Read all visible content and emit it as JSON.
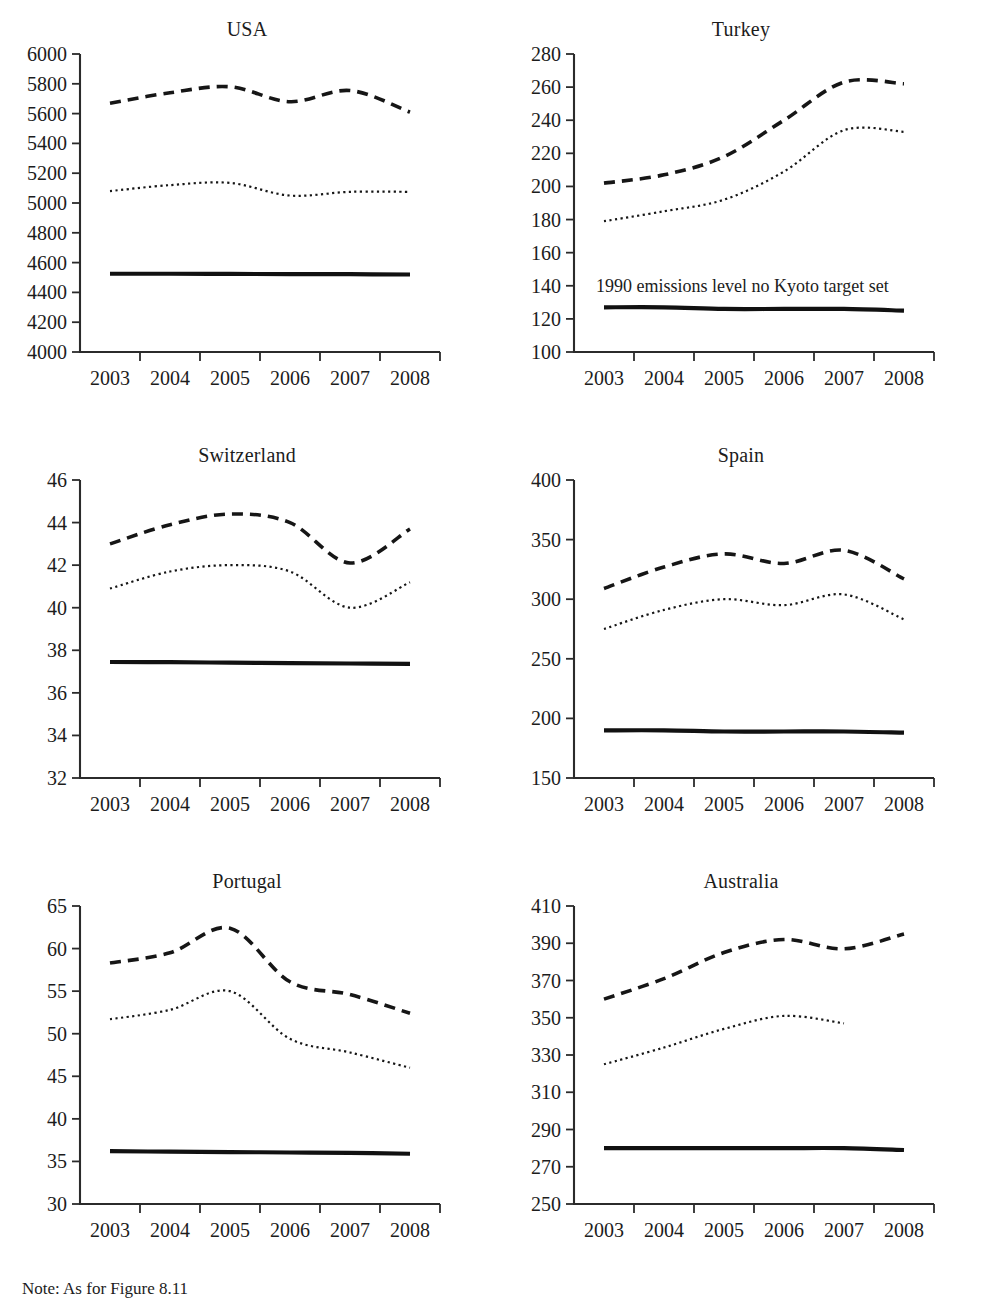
{
  "figure": {
    "note": "Note: As for Figure 8.11",
    "x_categories": [
      "2003",
      "2004",
      "2005",
      "2006",
      "2007",
      "2008"
    ],
    "series_names": [
      "Emissions including LULUCF (dashed)",
      "Emissions excluding LULUCF (dotted)",
      "1990 emissions level / Kyoto target (solid)"
    ],
    "annotation_turkey": "1990 emissions level no Kyoto target set"
  },
  "chart_data": [
    {
      "type": "line",
      "title": "USA",
      "xlabel": "",
      "ylabel": "",
      "x": [
        "2003",
        "2004",
        "2005",
        "2006",
        "2007",
        "2008"
      ],
      "ylim": [
        4000,
        6000
      ],
      "yticks": [
        4000,
        4200,
        4400,
        4600,
        4800,
        5000,
        5200,
        5400,
        5600,
        5800,
        6000
      ],
      "grid": false,
      "legend": "none",
      "series": [
        {
          "name": "dashed",
          "style": "dashed",
          "values": [
            5670,
            5740,
            5780,
            5680,
            5755,
            5610
          ]
        },
        {
          "name": "dotted",
          "style": "dotted",
          "values": [
            5080,
            5120,
            5135,
            5050,
            5075,
            5075
          ]
        },
        {
          "name": "reference",
          "style": "solid",
          "values": [
            4525,
            4525,
            4524,
            4523,
            4522,
            4520
          ]
        }
      ]
    },
    {
      "type": "line",
      "title": "Turkey",
      "xlabel": "",
      "ylabel": "",
      "x": [
        "2003",
        "2004",
        "2005",
        "2006",
        "2007",
        "2008"
      ],
      "ylim": [
        100,
        280
      ],
      "yticks": [
        100,
        120,
        140,
        160,
        180,
        200,
        220,
        240,
        260,
        280
      ],
      "grid": false,
      "legend": "none",
      "annotation": "1990 emissions level no Kyoto target set",
      "series": [
        {
          "name": "dashed",
          "style": "dashed",
          "values": [
            202,
            207,
            218,
            240,
            263,
            262
          ]
        },
        {
          "name": "dotted",
          "style": "dotted",
          "values": [
            179,
            185,
            192,
            209,
            234,
            233
          ]
        },
        {
          "name": "reference",
          "style": "solid",
          "values": [
            127,
            127,
            126,
            126,
            126,
            125
          ]
        }
      ]
    },
    {
      "type": "line",
      "title": "Switzerland",
      "xlabel": "",
      "ylabel": "",
      "x": [
        "2003",
        "2004",
        "2005",
        "2006",
        "2007",
        "2008"
      ],
      "ylim": [
        32,
        46
      ],
      "yticks": [
        32,
        34,
        36,
        38,
        40,
        42,
        44,
        46
      ],
      "grid": false,
      "legend": "none",
      "series": [
        {
          "name": "dashed",
          "style": "dashed",
          "values": [
            43.0,
            43.9,
            44.4,
            44.0,
            42.1,
            43.7
          ]
        },
        {
          "name": "dotted",
          "style": "dotted",
          "values": [
            40.9,
            41.7,
            42.0,
            41.7,
            40.0,
            41.2
          ]
        },
        {
          "name": "reference",
          "style": "solid",
          "values": [
            37.45,
            37.44,
            37.42,
            37.4,
            37.38,
            37.36
          ]
        }
      ]
    },
    {
      "type": "line",
      "title": "Spain",
      "xlabel": "",
      "ylabel": "",
      "x": [
        "2003",
        "2004",
        "2005",
        "2006",
        "2007",
        "2008"
      ],
      "ylim": [
        150,
        400
      ],
      "yticks": [
        150,
        200,
        250,
        300,
        350,
        400
      ],
      "grid": false,
      "legend": "none",
      "series": [
        {
          "name": "dashed",
          "style": "dashed",
          "values": [
            309,
            327,
            338,
            330,
            341,
            317
          ]
        },
        {
          "name": "dotted",
          "style": "dotted",
          "values": [
            275,
            291,
            300,
            295,
            304,
            283
          ]
        },
        {
          "name": "reference",
          "style": "solid",
          "values": [
            190,
            190,
            189,
            189,
            189,
            188
          ]
        }
      ]
    },
    {
      "type": "line",
      "title": "Portugal",
      "xlabel": "",
      "ylabel": "",
      "x": [
        "2003",
        "2004",
        "2005",
        "2006",
        "2007",
        "2008"
      ],
      "ylim": [
        30,
        65
      ],
      "yticks": [
        30,
        35,
        40,
        45,
        50,
        55,
        60,
        65
      ],
      "grid": false,
      "legend": "none",
      "series": [
        {
          "name": "dashed",
          "style": "dashed",
          "values": [
            58.3,
            59.5,
            62.4,
            56.1,
            54.6,
            52.4
          ]
        },
        {
          "name": "dotted",
          "style": "dotted",
          "values": [
            51.7,
            52.8,
            55.0,
            49.4,
            47.8,
            46.0
          ]
        },
        {
          "name": "reference",
          "style": "solid",
          "values": [
            36.2,
            36.15,
            36.1,
            36.05,
            36.0,
            35.9
          ]
        }
      ]
    },
    {
      "type": "line",
      "title": "Australia",
      "xlabel": "",
      "ylabel": "",
      "x": [
        "2003",
        "2004",
        "2005",
        "2006",
        "2007",
        "2008"
      ],
      "ylim": [
        250,
        410
      ],
      "yticks": [
        250,
        270,
        290,
        310,
        330,
        350,
        370,
        390,
        410
      ],
      "grid": false,
      "legend": "none",
      "series": [
        {
          "name": "dashed",
          "style": "dashed",
          "values": [
            360,
            371,
            385,
            392,
            387,
            395
          ]
        },
        {
          "name": "dotted",
          "style": "dotted",
          "values": [
            325,
            334,
            344,
            351,
            347,
            null
          ]
        },
        {
          "name": "reference",
          "style": "solid",
          "values": [
            280,
            280,
            280,
            280,
            280,
            279
          ]
        }
      ]
    }
  ]
}
